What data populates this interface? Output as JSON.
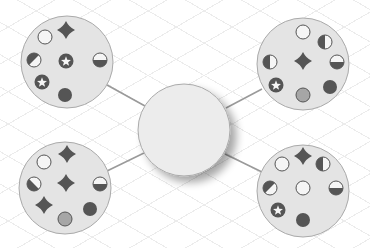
{
  "diagram": {
    "type": "hub-and-spoke",
    "colors": {
      "cluster_fill": "#e4e4e4",
      "cluster_stroke": "#aaaaaa",
      "hub_fill": "#ececec",
      "connector": "#9a9a9a",
      "icon_dark": "#555555",
      "icon_mid": "#a6a6a6",
      "icon_light": "#f5f5f5"
    },
    "hub": {
      "cx": 184,
      "cy": 130,
      "r": 46,
      "label": ""
    },
    "clusters": [
      {
        "id": "top-left",
        "cx": 67,
        "cy": 62,
        "r": 46,
        "icons": [
          {
            "type": "star4",
            "x": 66,
            "y": 30
          },
          {
            "type": "empty",
            "x": 45,
            "y": 37
          },
          {
            "type": "half-diag",
            "x": 34,
            "y": 60
          },
          {
            "type": "star-badge",
            "x": 66,
            "y": 61
          },
          {
            "type": "half-bottom",
            "x": 100,
            "y": 60
          },
          {
            "type": "star-badge",
            "x": 42,
            "y": 82
          },
          {
            "type": "full",
            "x": 65,
            "y": 95
          }
        ]
      },
      {
        "id": "top-right",
        "cx": 303,
        "cy": 64,
        "r": 46,
        "icons": [
          {
            "type": "empty",
            "x": 303,
            "y": 32
          },
          {
            "type": "half-left",
            "x": 325,
            "y": 42
          },
          {
            "type": "half-left",
            "x": 270,
            "y": 62
          },
          {
            "type": "star4",
            "x": 303,
            "y": 61
          },
          {
            "type": "half-bottom",
            "x": 337,
            "y": 62
          },
          {
            "type": "star-badge",
            "x": 276,
            "y": 85
          },
          {
            "type": "mid",
            "x": 303,
            "y": 95
          },
          {
            "type": "full",
            "x": 330,
            "y": 87
          }
        ]
      },
      {
        "id": "bottom-left",
        "cx": 65,
        "cy": 188,
        "r": 46,
        "icons": [
          {
            "type": "star4",
            "x": 67,
            "y": 154
          },
          {
            "type": "empty",
            "x": 44,
            "y": 162
          },
          {
            "type": "half-diag-rev",
            "x": 34,
            "y": 184
          },
          {
            "type": "star4",
            "x": 66,
            "y": 183
          },
          {
            "type": "half-bottom",
            "x": 100,
            "y": 184
          },
          {
            "type": "star4",
            "x": 44,
            "y": 205
          },
          {
            "type": "full",
            "x": 90,
            "y": 209
          },
          {
            "type": "mid",
            "x": 65,
            "y": 219
          }
        ]
      },
      {
        "id": "bottom-right",
        "cx": 303,
        "cy": 191,
        "r": 46,
        "icons": [
          {
            "type": "star4",
            "x": 303,
            "y": 156
          },
          {
            "type": "empty",
            "x": 282,
            "y": 164
          },
          {
            "type": "half-left",
            "x": 323,
            "y": 164
          },
          {
            "type": "half-diag",
            "x": 270,
            "y": 188
          },
          {
            "type": "empty",
            "x": 303,
            "y": 188
          },
          {
            "type": "half-bottom",
            "x": 336,
            "y": 188
          },
          {
            "type": "star-badge",
            "x": 278,
            "y": 210
          },
          {
            "type": "full",
            "x": 303,
            "y": 220
          }
        ]
      }
    ],
    "connectors": [
      {
        "from": "top-left",
        "x1": 107,
        "y1": 85,
        "x2": 145,
        "y2": 106
      },
      {
        "from": "top-right",
        "x1": 262,
        "y1": 89,
        "x2": 226,
        "y2": 108
      },
      {
        "from": "bottom-left",
        "x1": 107,
        "y1": 171,
        "x2": 144,
        "y2": 153
      },
      {
        "from": "bottom-right",
        "x1": 262,
        "y1": 172,
        "x2": 225,
        "y2": 154
      }
    ]
  }
}
